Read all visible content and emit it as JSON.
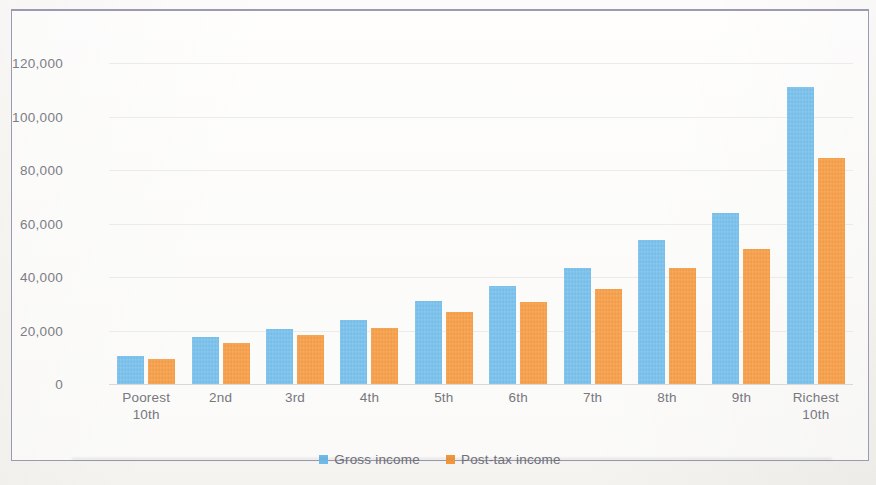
{
  "figure": {
    "border_color": "#9a9ab4",
    "background": "#fbfaf7"
  },
  "legend": {
    "position": "bottom-center",
    "items": [
      {
        "label": "Gross income",
        "color": "#6ebae8",
        "swatch": "legend-swatch-gross"
      },
      {
        "label": "Post-tax income",
        "color": "#f3963b",
        "swatch": "legend-swatch-posttax"
      }
    ]
  },
  "axis": {
    "y_ticks": [
      "0",
      "20,000",
      "40,000",
      "60,000",
      "80,000",
      "100,000",
      "120,000"
    ],
    "y_tick_values": [
      0,
      20000,
      40000,
      60000,
      80000,
      100000,
      120000
    ],
    "x_labels": [
      "Poorest\n10th",
      "2nd",
      "3rd",
      "4th",
      "5th",
      "6th",
      "7th",
      "8th",
      "9th",
      "Richest\n10th"
    ]
  },
  "chart_data": {
    "type": "bar",
    "title": "",
    "subtitle": "",
    "xlabel": "",
    "ylabel": "",
    "ylim": [
      0,
      120000
    ],
    "ytick_step": 20000,
    "grid": true,
    "legend_position": "bottom",
    "categories": [
      "Poorest 10th",
      "2nd",
      "3rd",
      "4th",
      "5th",
      "6th",
      "7th",
      "8th",
      "9th",
      "Richest 10th"
    ],
    "series": [
      {
        "name": "Gross income",
        "color": "#6ebae8",
        "values": [
          10500,
          17500,
          20500,
          24000,
          31000,
          36500,
          43500,
          54000,
          64000,
          111000
        ]
      },
      {
        "name": "Post-tax income",
        "color": "#f3963b",
        "values": [
          9500,
          15500,
          18500,
          21000,
          27000,
          30500,
          35500,
          43500,
          50500,
          84500
        ]
      }
    ]
  }
}
